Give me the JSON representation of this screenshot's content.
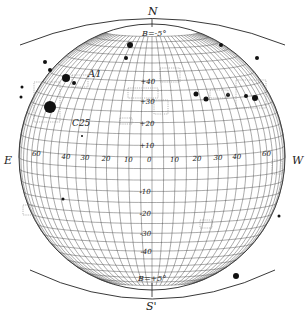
{
  "diagram": {
    "pole_north_label": "N",
    "pole_south_label": "S'",
    "east_label": "E",
    "west_label": "W",
    "b_angle_top": "B=-5°",
    "b_angle_bottom": "B=+5°",
    "region_labels": [
      "A1",
      "C25"
    ],
    "longitude_ticks": [
      "60",
      "40",
      "30",
      "20",
      "10",
      "0",
      "10",
      "20",
      "30",
      "40",
      "60"
    ],
    "latitude_ticks_north": [
      "+40",
      "+30",
      "+20",
      "+10"
    ],
    "latitude_ticks_south": [
      "-10",
      "-20",
      "-30",
      "-40"
    ],
    "grid_step_degrees": 5,
    "line_color": "#444444",
    "spot_color": "#111111",
    "faculae_color": "#888888"
  }
}
